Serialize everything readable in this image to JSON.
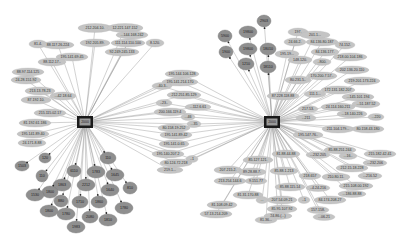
{
  "diagram": {
    "type": "network-graph",
    "hubs": [
      {
        "id": "hub-left",
        "label": "2000",
        "x": 85,
        "y": 122
      },
      {
        "id": "hub-right",
        "label": "2000",
        "x": 272,
        "y": 122
      }
    ],
    "colors": {
      "ip_node": "#c4c4c4",
      "port_node": "#8f8f8f",
      "hub": "#1a1a1a",
      "edge": "#8a8a8a",
      "background": "#ffffff"
    },
    "left_ip_nodes": [
      {
        "label": "212.204.10.",
        "x": 95,
        "y": 28,
        "w": 34,
        "h": 9
      },
      {
        "label": "12.221.147.152",
        "x": 125,
        "y": 28,
        "w": 36,
        "h": 9
      },
      {
        "label": "...144.168.242",
        "x": 132,
        "y": 35,
        "w": 32,
        "h": 8
      },
      {
        "label": "81.4.",
        "x": 38,
        "y": 44,
        "w": 18,
        "h": 8
      },
      {
        "label": "88.117.26.224",
        "x": 58,
        "y": 45,
        "w": 32,
        "h": 8
      },
      {
        "label": "192.205.89.",
        "x": 95,
        "y": 43,
        "w": 30,
        "h": 8
      },
      {
        "label": "111.114.110.100",
        "x": 128,
        "y": 43,
        "w": 34,
        "h": 8
      },
      {
        "label": "8.120.",
        "x": 155,
        "y": 43,
        "w": 18,
        "h": 8
      },
      {
        "label": "92.249.245.133",
        "x": 122,
        "y": 52,
        "w": 34,
        "h": 8
      },
      {
        "label": "195.141.69.45",
        "x": 72,
        "y": 57,
        "w": 32,
        "h": 8
      },
      {
        "label": "88.112.17..",
        "x": 52,
        "y": 62,
        "w": 28,
        "h": 8
      },
      {
        "label": "88.97.114.125",
        "x": 28,
        "y": 72,
        "w": 32,
        "h": 8
      },
      {
        "label": "24.28.151.92",
        "x": 26,
        "y": 80,
        "w": 30,
        "h": 8
      },
      {
        "label": "213.13.78.23",
        "x": 40,
        "y": 91,
        "w": 30,
        "h": 8
      },
      {
        "label": "...42.18.64",
        "x": 63,
        "y": 96,
        "w": 26,
        "h": 8
      },
      {
        "label": "87.192.10.",
        "x": 36,
        "y": 100,
        "w": 30,
        "h": 8
      },
      {
        "label": "215.115.02.17",
        "x": 50,
        "y": 113,
        "w": 32,
        "h": 8
      },
      {
        "label": "81.192.61.186",
        "x": 35,
        "y": 123,
        "w": 32,
        "h": 8
      },
      {
        "label": "195.141.89.40",
        "x": 33,
        "y": 134,
        "w": 32,
        "h": 8
      },
      {
        "label": "24.171.8.88",
        "x": 32,
        "y": 143,
        "w": 28,
        "h": 8
      }
    ],
    "middle_ip_nodes": [
      {
        "label": "195.144.106.128",
        "x": 182,
        "y": 74,
        "w": 34,
        "h": 8
      },
      {
        "label": "195.141.214.170",
        "x": 180,
        "y": 82,
        "w": 36,
        "h": 8
      },
      {
        "label": "..40.3..",
        "x": 162,
        "y": 86,
        "w": 20,
        "h": 7
      },
      {
        "label": "212.251.85.129",
        "x": 184,
        "y": 95,
        "w": 34,
        "h": 8
      },
      {
        "label": "..23..",
        "x": 164,
        "y": 103,
        "w": 16,
        "h": 7
      },
      {
        "label": "...112.6.61",
        "x": 198,
        "y": 107,
        "w": 26,
        "h": 7
      },
      {
        "label": "200.166.119.4",
        "x": 170,
        "y": 112,
        "w": 32,
        "h": 8
      },
      {
        "label": "...46",
        "x": 188,
        "y": 117,
        "w": 14,
        "h": 7
      },
      {
        "label": "...35",
        "x": 194,
        "y": 124,
        "w": 14,
        "h": 7
      },
      {
        "label": "80.158.19.252",
        "x": 174,
        "y": 128,
        "w": 32,
        "h": 8
      },
      {
        "label": "195.141.89.42",
        "x": 176,
        "y": 135,
        "w": 32,
        "h": 8
      },
      {
        "label": "195.141.0.65",
        "x": 174,
        "y": 144,
        "w": 30,
        "h": 8
      },
      {
        "label": "195.140.207.2",
        "x": 168,
        "y": 154,
        "w": 32,
        "h": 8
      },
      {
        "label": "..1",
        "x": 192,
        "y": 159,
        "w": 12,
        "h": 7
      },
      {
        "label": "80.124.72.218",
        "x": 176,
        "y": 163,
        "w": 32,
        "h": 8
      },
      {
        "label": "219.1...",
        "x": 170,
        "y": 170,
        "w": 26,
        "h": 7
      }
    ],
    "right_ip_nodes": [
      {
        "label": "197.",
        "x": 298,
        "y": 32,
        "w": 20,
        "h": 8
      },
      {
        "label": "201.1...",
        "x": 315,
        "y": 35,
        "w": 30,
        "h": 8
      },
      {
        "label": "24.66.2.",
        "x": 295,
        "y": 42,
        "w": 22,
        "h": 8
      },
      {
        "label": "84.136.80.187",
        "x": 322,
        "y": 42,
        "w": 32,
        "h": 8
      },
      {
        "label": "74.152.",
        "x": 345,
        "y": 45,
        "w": 20,
        "h": 8
      },
      {
        "label": "195.19...",
        "x": 287,
        "y": 54,
        "w": 24,
        "h": 8
      },
      {
        "label": "84.136.177.",
        "x": 325,
        "y": 52,
        "w": 28,
        "h": 8
      },
      {
        "label": "218.00.104.186",
        "x": 350,
        "y": 57,
        "w": 34,
        "h": 8
      },
      {
        "label": "148.120.",
        "x": 300,
        "y": 60,
        "w": 24,
        "h": 8
      },
      {
        "label": "..800.",
        "x": 322,
        "y": 62,
        "w": 18,
        "h": 7
      },
      {
        "label": "202.136.20.110",
        "x": 352,
        "y": 70,
        "w": 34,
        "h": 8
      },
      {
        "label": "80.231.5..",
        "x": 298,
        "y": 80,
        "w": 26,
        "h": 8
      },
      {
        "label": "170.200.7.57..",
        "x": 322,
        "y": 76,
        "w": 30,
        "h": 8
      },
      {
        "label": "219.201.173.224",
        "x": 362,
        "y": 81,
        "w": 36,
        "h": 8
      },
      {
        "label": "172.131.182.207",
        "x": 338,
        "y": 90,
        "w": 34,
        "h": 8
      },
      {
        "label": "87.228.118.88",
        "x": 283,
        "y": 96,
        "w": 32,
        "h": 8
      },
      {
        "label": "111.1...",
        "x": 315,
        "y": 94,
        "w": 22,
        "h": 7
      },
      {
        "label": "...145.101.194",
        "x": 358,
        "y": 97,
        "w": 32,
        "h": 8
      },
      {
        "label": "24.114.160.211",
        "x": 338,
        "y": 107,
        "w": 34,
        "h": 8
      },
      {
        "label": "...51.187.52",
        "x": 366,
        "y": 104,
        "w": 28,
        "h": 8
      },
      {
        "label": "217.53.",
        "x": 308,
        "y": 109,
        "w": 20,
        "h": 7
      },
      {
        "label": "...18.140.226",
        "x": 352,
        "y": 114,
        "w": 30,
        "h": 8
      },
      {
        "label": "...220",
        "x": 376,
        "y": 117,
        "w": 16,
        "h": 7
      },
      {
        "label": "...211",
        "x": 306,
        "y": 118,
        "w": 20,
        "h": 7
      },
      {
        "label": "211.104.179...",
        "x": 338,
        "y": 129,
        "w": 32,
        "h": 8
      },
      {
        "label": "80.158.43.180",
        "x": 368,
        "y": 129,
        "w": 32,
        "h": 8
      },
      {
        "label": "195.147.76..",
        "x": 308,
        "y": 135,
        "w": 30,
        "h": 8
      }
    ],
    "bottom_right_ip_nodes": [
      {
        "label": "85.88.251.244",
        "x": 340,
        "y": 150,
        "w": 32,
        "h": 8
      },
      {
        "label": "...16..",
        "x": 348,
        "y": 156,
        "w": 18,
        "h": 7
      },
      {
        "label": "215.182.42.41",
        "x": 380,
        "y": 154,
        "w": 32,
        "h": 8
      },
      {
        "label": "85.127.121.",
        "x": 258,
        "y": 160,
        "w": 30,
        "h": 8
      },
      {
        "label": "81.88.44.88",
        "x": 286,
        "y": 154,
        "w": 28,
        "h": 8
      },
      {
        "label": "...232.205",
        "x": 318,
        "y": 155,
        "w": 24,
        "h": 7
      },
      {
        "label": "...232.206",
        "x": 375,
        "y": 163,
        "w": 24,
        "h": 7
      },
      {
        "label": "207.215.2.",
        "x": 228,
        "y": 170,
        "w": 28,
        "h": 8
      },
      {
        "label": "89.28.88.7.",
        "x": 252,
        "y": 172,
        "w": 28,
        "h": 8
      },
      {
        "label": "85.88.1.213",
        "x": 284,
        "y": 171,
        "w": 28,
        "h": 8
      },
      {
        "label": "212.15.18.228",
        "x": 352,
        "y": 168,
        "w": 32,
        "h": 8
      },
      {
        "label": "218.657",
        "x": 310,
        "y": 176,
        "w": 22,
        "h": 7
      },
      {
        "label": "210.80.11.",
        "x": 336,
        "y": 177,
        "w": 28,
        "h": 8
      },
      {
        "label": "...216.52",
        "x": 370,
        "y": 176,
        "w": 24,
        "h": 7
      },
      {
        "label": "213.254.144.6",
        "x": 230,
        "y": 181,
        "w": 32,
        "h": 8
      },
      {
        "label": "9.151.77",
        "x": 256,
        "y": 181,
        "w": 22,
        "h": 7
      },
      {
        "label": "85.88.115.14",
        "x": 290,
        "y": 187,
        "w": 30,
        "h": 8
      },
      {
        "label": "..4.24.216",
        "x": 318,
        "y": 188,
        "w": 24,
        "h": 7
      },
      {
        "label": "215.108.00.192",
        "x": 356,
        "y": 186,
        "w": 34,
        "h": 8
      },
      {
        "label": "...186.88.88",
        "x": 352,
        "y": 194,
        "w": 28,
        "h": 7
      },
      {
        "label": "81.31.170.88",
        "x": 248,
        "y": 195,
        "w": 30,
        "h": 8
      },
      {
        "label": "207.54.09.21",
        "x": 282,
        "y": 200,
        "w": 30,
        "h": 8
      },
      {
        "label": "..1",
        "x": 304,
        "y": 200,
        "w": 12,
        "h": 7
      },
      {
        "label": "84.174.208.27",
        "x": 330,
        "y": 200,
        "w": 32,
        "h": 8
      },
      {
        "label": "...",
        "x": 262,
        "y": 200,
        "w": 12,
        "h": 7
      },
      {
        "label": "81.108.09.42",
        "x": 222,
        "y": 205,
        "w": 30,
        "h": 8
      },
      {
        "label": "85.95.107.92",
        "x": 282,
        "y": 209,
        "w": 30,
        "h": 8
      },
      {
        "label": "157.158.",
        "x": 318,
        "y": 210,
        "w": 22,
        "h": 7
      },
      {
        "label": "57.13.214.209",
        "x": 216,
        "y": 214,
        "w": 32,
        "h": 8
      },
      {
        "label": "24.86.(...)",
        "x": 278,
        "y": 216,
        "w": 28,
        "h": 7
      },
      {
        "label": "...06.21",
        "x": 324,
        "y": 217,
        "w": 22,
        "h": 7
      },
      {
        "label": "81.36...",
        "x": 266,
        "y": 220,
        "w": 22,
        "h": 7
      }
    ],
    "left_port_nodes": [
      {
        "label": "120",
        "x": 45,
        "y": 158,
        "rx": 6,
        "ry": 5
      },
      {
        "label": "1503",
        "x": 22,
        "y": 166,
        "rx": 7,
        "ry": 5
      },
      {
        "label": "110",
        "x": 108,
        "y": 158,
        "rx": 8,
        "ry": 6
      },
      {
        "label": "6110",
        "x": 74,
        "y": 171,
        "rx": 7,
        "ry": 6
      },
      {
        "label": "1783",
        "x": 96,
        "y": 172,
        "rx": 9,
        "ry": 6
      },
      {
        "label": "1645",
        "x": 115,
        "y": 175,
        "rx": 9,
        "ry": 6
      },
      {
        "label": "110",
        "x": 42,
        "y": 176,
        "rx": 6,
        "ry": 6
      },
      {
        "label": "1863",
        "x": 62,
        "y": 185,
        "rx": 9,
        "ry": 6
      },
      {
        "label": "2212",
        "x": 86,
        "y": 185,
        "rx": 9,
        "ry": 6
      },
      {
        "label": "1640",
        "x": 110,
        "y": 190,
        "rx": 9,
        "ry": 6
      },
      {
        "label": "810",
        "x": 130,
        "y": 188,
        "rx": 7,
        "ry": 6
      },
      {
        "label": "1800",
        "x": 50,
        "y": 192,
        "rx": 8,
        "ry": 6
      },
      {
        "label": "1530",
        "x": 35,
        "y": 195,
        "rx": 9,
        "ry": 6
      },
      {
        "label": "880",
        "x": 61,
        "y": 201,
        "rx": 7,
        "ry": 6
      },
      {
        "label": "1710",
        "x": 80,
        "y": 202,
        "rx": 8,
        "ry": 6
      },
      {
        "label": "1860",
        "x": 99,
        "y": 202,
        "rx": 8,
        "ry": 6
      },
      {
        "label": "1780",
        "x": 124,
        "y": 208,
        "rx": 9,
        "ry": 6
      },
      {
        "label": "1800",
        "x": 49,
        "y": 211,
        "rx": 9,
        "ry": 6
      },
      {
        "label": "1780",
        "x": 66,
        "y": 214,
        "rx": 9,
        "ry": 6
      },
      {
        "label": "2080",
        "x": 90,
        "y": 217,
        "rx": 8,
        "ry": 6
      },
      {
        "label": "1810",
        "x": 108,
        "y": 220,
        "rx": 9,
        "ry": 6
      },
      {
        "label": "1983",
        "x": 76,
        "y": 227,
        "rx": 9,
        "ry": 6
      }
    ],
    "right_port_nodes": [
      {
        "label": "2903",
        "x": 264,
        "y": 21,
        "rx": 7,
        "ry": 6
      },
      {
        "label": "5900",
        "x": 225,
        "y": 36,
        "rx": 7,
        "ry": 6
      },
      {
        "label": "19800",
        "x": 248,
        "y": 32,
        "rx": 9,
        "ry": 6
      },
      {
        "label": "1900",
        "x": 226,
        "y": 52,
        "rx": 7,
        "ry": 6
      },
      {
        "label": "19800",
        "x": 248,
        "y": 49,
        "rx": 9,
        "ry": 6
      },
      {
        "label": "18010",
        "x": 268,
        "y": 49,
        "rx": 8,
        "ry": 6
      },
      {
        "label": "1210",
        "x": 246,
        "y": 64,
        "rx": 8,
        "ry": 6
      },
      {
        "label": "18110",
        "x": 268,
        "y": 67,
        "rx": 8,
        "ry": 6
      }
    ]
  }
}
